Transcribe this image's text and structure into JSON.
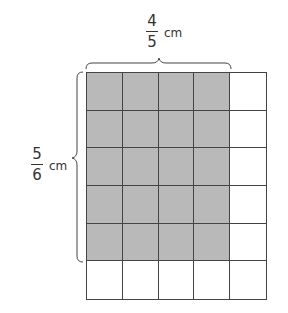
{
  "diagram": {
    "grid": {
      "columns": 5,
      "rows": 6,
      "shaded_columns": 4,
      "shaded_rows": 5,
      "shade_color": "#b9b9b9",
      "line_color": "#444444"
    },
    "top_label": {
      "numerator": "4",
      "denominator": "5",
      "unit": "cm"
    },
    "left_label": {
      "numerator": "5",
      "denominator": "6",
      "unit": "cm"
    }
  }
}
